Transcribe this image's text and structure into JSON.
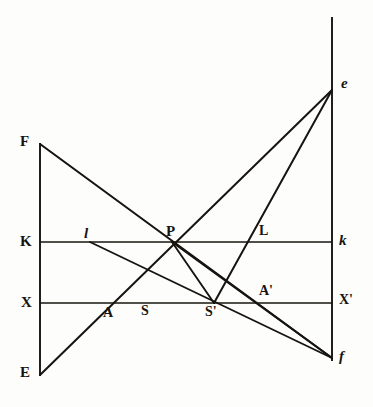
{
  "figure": {
    "width": 373,
    "height": 407,
    "background_color": "#fdfdfc",
    "ink_color": "#17140f"
  },
  "axes": {
    "left_vertical": {
      "name": "left-vertical-axis",
      "x": 40,
      "y_top": 143,
      "y_bottom": 376
    },
    "right_vertical": {
      "name": "right-vertical-axis",
      "x": 332,
      "y_top": 17,
      "y_bottom": 361
    },
    "optical_axis_K_k": {
      "name": "axis-K-k",
      "y": 242,
      "x_left": 40,
      "x_right": 332
    },
    "optical_axis_X_Xprime": {
      "name": "axis-X-Xprime",
      "y": 303,
      "x_left": 40,
      "x_right": 332
    }
  },
  "points": {
    "F": {
      "label": "F",
      "x": 40,
      "y": 144,
      "label_x": 20,
      "label_y": 141,
      "style": "upright"
    },
    "E": {
      "label": "E",
      "x": 40,
      "y": 375,
      "label_x": 20,
      "label_y": 371,
      "style": "upright"
    },
    "K": {
      "label": "K",
      "x": 40,
      "y": 242,
      "label_x": 20,
      "label_y": 240,
      "style": "upright"
    },
    "X": {
      "label": "X",
      "x": 40,
      "y": 303,
      "label_x": 21,
      "label_y": 301,
      "style": "upright"
    },
    "l": {
      "label": "l",
      "x": 90,
      "y": 242,
      "label_x": 84,
      "label_y": 231,
      "style": "italic"
    },
    "P": {
      "label": "P",
      "x": 172,
      "y": 242,
      "label_x": 166,
      "label_y": 228,
      "style": "upright"
    },
    "L": {
      "label": "L",
      "x": 255,
      "y": 242,
      "label_x": 259,
      "label_y": 228,
      "style": "upright"
    },
    "k": {
      "label": "k",
      "x": 332,
      "y": 242,
      "label_x": 339,
      "label_y": 236,
      "style": "italic"
    },
    "A": {
      "label": "A",
      "x": 111,
      "y": 303,
      "label_x": 104,
      "label_y": 309,
      "style": "upright"
    },
    "S": {
      "label": "S",
      "x": 148,
      "y": 303,
      "label_x": 141,
      "label_y": 307,
      "style": "upright"
    },
    "Sp": {
      "label": "S'",
      "x": 214,
      "y": 303,
      "label_x": 206,
      "label_y": 308,
      "style": "upright"
    },
    "Ap": {
      "label": "A'",
      "x": 258,
      "y": 303,
      "label_x": 259,
      "label_y": 288,
      "style": "upright"
    },
    "Xp": {
      "label": "X'",
      "x": 332,
      "y": 303,
      "label_x": 340,
      "label_y": 296,
      "style": "upright"
    },
    "e": {
      "label": "e",
      "x": 332,
      "y": 90,
      "label_x": 341,
      "label_y": 79,
      "style": "italic"
    },
    "f": {
      "label": "f",
      "x": 332,
      "y": 358,
      "label_x": 339,
      "label_y": 352,
      "style": "italic"
    }
  },
  "rays": [
    {
      "name": "ray-F-to-f",
      "from": "F",
      "to": "f",
      "x1": 40,
      "y1": 144,
      "x2": 332,
      "y2": 358
    },
    {
      "name": "ray-E-to-e",
      "from": "E",
      "to": "e",
      "x1": 40,
      "y1": 375,
      "x2": 332,
      "y2": 90
    },
    {
      "name": "ray-l-to-f",
      "from": "l",
      "to": "f",
      "x1": 90,
      "y1": 242,
      "x2": 332,
      "y2": 358
    },
    {
      "name": "ray-P-to-Sprime",
      "from": "P",
      "to": "Sprime",
      "x1": 172,
      "y1": 242,
      "x2": 214,
      "y2": 303
    },
    {
      "name": "ray-P-to-f",
      "from": "P",
      "to": "f",
      "x1": 172,
      "y1": 242,
      "x2": 332,
      "y2": 358
    },
    {
      "name": "ray-Sprime-to-e",
      "from": "Sprime",
      "to": "e",
      "x1": 214,
      "y1": 303,
      "x2": 332,
      "y2": 90
    }
  ],
  "line_widths": {
    "axis": 1.8,
    "ray": 2.0
  }
}
